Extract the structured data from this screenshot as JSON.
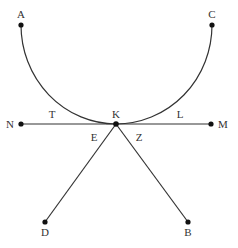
{
  "diagram": {
    "type": "geometric-figure",
    "background": "#ffffff",
    "stroke_color": "#333333",
    "point_color": "#111111",
    "points": {
      "A": {
        "label": "A",
        "x": 21,
        "y": 25
      },
      "C": {
        "label": "C",
        "x": 212,
        "y": 25
      },
      "K": {
        "label": "K",
        "x": 116,
        "y": 124
      },
      "N": {
        "label": "N",
        "x": 21,
        "y": 124
      },
      "M": {
        "label": "M",
        "x": 211,
        "y": 124
      },
      "D": {
        "label": "D",
        "x": 45,
        "y": 222
      },
      "B": {
        "label": "B",
        "x": 188,
        "y": 222
      }
    },
    "segment_labels": {
      "T": {
        "label": "T",
        "x": 52,
        "y": 118
      },
      "L": {
        "label": "L",
        "x": 180,
        "y": 118
      },
      "E": {
        "label": "E",
        "x": 94,
        "y": 141
      },
      "Z": {
        "label": "Z",
        "x": 139,
        "y": 141
      }
    },
    "curves": [
      {
        "name": "arc-AKC",
        "from": "A",
        "through": "K",
        "to": "C",
        "description": "curve from A down through K up to C, tangent to NM at K"
      }
    ],
    "lines": [
      {
        "name": "line-NM",
        "from": "N",
        "to": "M"
      },
      {
        "name": "line-KD",
        "from": "K",
        "to": "D"
      },
      {
        "name": "line-KB",
        "from": "K",
        "to": "B"
      }
    ]
  }
}
